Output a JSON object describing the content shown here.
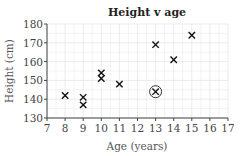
{
  "chart_data": {
    "type": "scatter",
    "title": "Height v age",
    "xlabel": "Age (years)",
    "ylabel": "Height (cm)",
    "xlim": [
      7,
      17
    ],
    "ylim": [
      130,
      180
    ],
    "xticks": [
      7,
      8,
      9,
      10,
      11,
      12,
      13,
      14,
      15,
      16,
      17
    ],
    "yticks": [
      130,
      140,
      150,
      160,
      170,
      180
    ],
    "grid": true,
    "marker": "x",
    "points": [
      {
        "x": 8,
        "y": 142
      },
      {
        "x": 9,
        "y": 141
      },
      {
        "x": 9,
        "y": 137
      },
      {
        "x": 10,
        "y": 154
      },
      {
        "x": 10,
        "y": 151
      },
      {
        "x": 11,
        "y": 148
      },
      {
        "x": 13,
        "y": 169
      },
      {
        "x": 14,
        "y": 161
      },
      {
        "x": 15,
        "y": 174
      }
    ],
    "annotations": [
      {
        "type": "circled-point",
        "x": 13,
        "y": 144,
        "note": "outlier"
      }
    ]
  }
}
